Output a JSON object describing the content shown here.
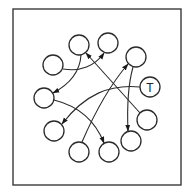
{
  "diagram": {
    "type": "directed-graph",
    "frame": {
      "x": 13,
      "y": 9,
      "width": 168,
      "height": 176
    },
    "node_radius": 10,
    "colors": {
      "stroke": "#2a2a2a",
      "fill": "#ffffff",
      "background": "#ffffff"
    },
    "nodes": [
      {
        "id": "n1",
        "label": "",
        "x": 79,
        "y": 45
      },
      {
        "id": "n2",
        "label": "",
        "x": 108,
        "y": 43
      },
      {
        "id": "n3",
        "label": "",
        "x": 136,
        "y": 57
      },
      {
        "id": "T",
        "label": "T",
        "x": 150,
        "y": 87
      },
      {
        "id": "n5",
        "label": "",
        "x": 147,
        "y": 120
      },
      {
        "id": "n6",
        "label": "",
        "x": 131,
        "y": 141
      },
      {
        "id": "n7",
        "label": "",
        "x": 109,
        "y": 152
      },
      {
        "id": "n8",
        "label": "",
        "x": 79,
        "y": 152
      },
      {
        "id": "n9",
        "label": "",
        "x": 54,
        "y": 131
      },
      {
        "id": "n10",
        "label": "",
        "x": 44,
        "y": 98
      },
      {
        "id": "n11",
        "label": "",
        "x": 53,
        "y": 65
      }
    ],
    "edges": [
      {
        "from": "n11",
        "to": "n2",
        "shape": "curve"
      },
      {
        "from": "n1",
        "to": "n10",
        "shape": "curve"
      },
      {
        "from": "n5",
        "to": "n1",
        "shape": "straight"
      },
      {
        "from": "n8",
        "to": "n3",
        "shape": "straight"
      },
      {
        "from": "T",
        "to": "n9",
        "shape": "curve"
      },
      {
        "from": "n10",
        "to": "n7",
        "shape": "curve"
      },
      {
        "from": "n3",
        "to": "n6",
        "shape": "straight"
      }
    ]
  }
}
